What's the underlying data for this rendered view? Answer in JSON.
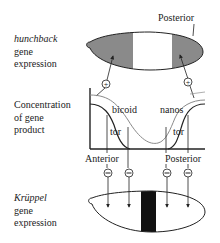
{
  "top_panel": {
    "label_line1": "hunchback",
    "label_line2": "gene",
    "label_line3": "expression",
    "posterior_label": "Posterior"
  },
  "middle_panel": {
    "label_line1": "Concentration",
    "label_line2": "of gene",
    "label_line3": "product",
    "curves": {
      "bicoid": "bicoid",
      "nanos": "nanos",
      "tor_left": "tor",
      "tor_right": "tor"
    },
    "anterior_label": "Anterior",
    "posterior_label": "Posterior"
  },
  "bottom_panel": {
    "label_line1": "Krüppel",
    "label_line2": "gene",
    "label_line3": "expression"
  },
  "symbols": {
    "plus": "+",
    "minus": "−"
  },
  "colors": {
    "gray_region": "#8a8a8a",
    "black_band": "#111111",
    "line": "#222222",
    "light_curve": "#9a9a9a"
  }
}
